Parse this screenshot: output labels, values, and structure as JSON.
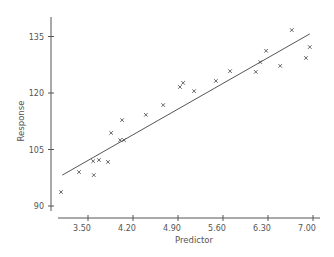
{
  "chart_data": {
    "type": "scatter",
    "title": "",
    "xlabel": "Predictor",
    "ylabel": "Response",
    "xlim": [
      3.05,
      7.1
    ],
    "ylim": [
      88.5,
      141
    ],
    "x_ticks": [
      3.5,
      4.2,
      4.9,
      5.6,
      6.3,
      7.0
    ],
    "x_tick_labels": [
      "3.50",
      "4.20",
      "4.90",
      "5.60",
      "6.30",
      "7.00"
    ],
    "y_ticks": [
      90,
      105,
      120,
      135
    ],
    "y_tick_labels": [
      "90",
      "105",
      "120",
      "135"
    ],
    "grid": false,
    "legend": null,
    "marker": "x",
    "color": "#555555",
    "series": [
      {
        "name": "observations",
        "points": [
          [
            3.08,
            93.7
          ],
          [
            3.36,
            99.0
          ],
          [
            3.58,
            101.9
          ],
          [
            3.59,
            98.2
          ],
          [
            3.67,
            102.2
          ],
          [
            3.81,
            101.7
          ],
          [
            3.86,
            109.4
          ],
          [
            4.0,
            107.5
          ],
          [
            4.06,
            107.5
          ],
          [
            4.03,
            112.8
          ],
          [
            4.4,
            114.2
          ],
          [
            4.67,
            116.8
          ],
          [
            4.93,
            121.6
          ],
          [
            4.98,
            122.7
          ],
          [
            5.15,
            120.5
          ],
          [
            5.49,
            123.2
          ],
          [
            5.71,
            125.8
          ],
          [
            6.11,
            125.6
          ],
          [
            6.18,
            128.2
          ],
          [
            6.27,
            131.2
          ],
          [
            6.49,
            127.2
          ],
          [
            6.67,
            136.7
          ],
          [
            6.89,
            129.3
          ],
          [
            6.95,
            132.2
          ]
        ]
      }
    ],
    "fit_line": {
      "name": "fitted line",
      "x": [
        3.1,
        6.95
      ],
      "y": [
        98.2,
        135.7
      ]
    }
  }
}
